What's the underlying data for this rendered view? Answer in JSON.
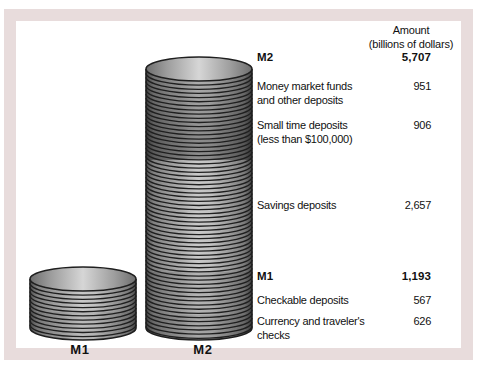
{
  "colors": {
    "frame": "#e8dcdc",
    "coin_light": "#c9c9c9",
    "coin_mid": "#818181",
    "coin_dark": "#4f4f4f",
    "outline": "#1f1f1f",
    "text": "#111111"
  },
  "header": {
    "line1": "Amount",
    "line2": "(billions of dollars)"
  },
  "rows": [
    {
      "label": "M2",
      "value": "5,707"
    },
    {
      "label": "Money market funds",
      "label2": "and other deposits",
      "value": "951"
    },
    {
      "label": "Small time deposits",
      "label2": "(less than $100,000)",
      "value": "906"
    },
    {
      "label": "Savings deposits",
      "value": "2,657"
    },
    {
      "label": "M1",
      "value": "1,193"
    },
    {
      "label": "Checkable deposits",
      "value": "567"
    },
    {
      "label": "Currency and traveler's checks",
      "value": "626"
    }
  ],
  "chart_data": {
    "type": "bar",
    "title": "",
    "unit": "billions of dollars",
    "categories": [
      "M1",
      "M2"
    ],
    "values": [
      1193,
      5707
    ],
    "components": {
      "M1": [
        {
          "label": "Checkable deposits",
          "value": 567
        },
        {
          "label": "Currency and traveler's checks",
          "value": 626
        }
      ],
      "M2": [
        {
          "label": "M1",
          "value": 1193
        },
        {
          "label": "Savings deposits",
          "value": 2657
        },
        {
          "label": "Small time deposits (less than $100,000)",
          "value": 906
        },
        {
          "label": "Money market funds and other deposits",
          "value": 951
        }
      ]
    },
    "legend_position": "right",
    "grid": false
  }
}
